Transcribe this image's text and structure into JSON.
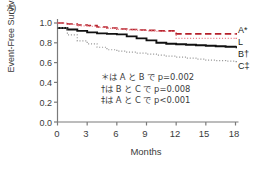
{
  "panel": {
    "label": "A)"
  },
  "axes": {
    "ylabel": "Event-Free Survival",
    "xlabel": "Months",
    "yticks": [
      "1.0",
      "0.8",
      "0.6",
      "0.4",
      "0.2",
      "0.0"
    ],
    "xticks": [
      "0",
      "3",
      "6",
      "9",
      "12",
      "15",
      "18"
    ]
  },
  "curve_labels": [
    {
      "text": "A*",
      "name": "curve-label-a"
    },
    {
      "text": "L",
      "name": "curve-label-l"
    },
    {
      "text": "B†",
      "name": "curve-label-b"
    },
    {
      "text": "C‡",
      "name": "curve-label-c"
    }
  ],
  "notes": [
    "＊は A と B で p=0.002",
    "†は B と C で p=0.008",
    "‡は A と C で p<0.001"
  ],
  "colors": {
    "series_a": "#b5202b",
    "series_l": "#e8838c",
    "series_b": "#111111",
    "series_c": "#9a9a9a",
    "axis": "#7a7a7a",
    "text": "#3b3b3b"
  },
  "chart_data": {
    "type": "line",
    "title": "",
    "subtitle": "",
    "xlabel": "Months",
    "ylabel": "Event-Free Survival",
    "xlim": [
      0,
      18
    ],
    "ylim": [
      0.0,
      1.0
    ],
    "xticks": [
      0,
      3,
      6,
      9,
      12,
      15,
      18
    ],
    "yticks": [
      0.0,
      0.2,
      0.4,
      0.6,
      0.8,
      1.0
    ],
    "grid": false,
    "legend_position": "right-of-plot-inline-labels",
    "step_curves": true,
    "annotations": [
      "＊は A と B で p=0.002",
      "†は B と C で p=0.008",
      "‡は A と C で p<0.001"
    ],
    "series": [
      {
        "name": "A",
        "label": "A*",
        "color": "#b5202b",
        "style": "dashed",
        "width": 1.6,
        "x": [
          0,
          1,
          2,
          3,
          4,
          5,
          6,
          7,
          8,
          9,
          10,
          11,
          12,
          13,
          14,
          15,
          16,
          17,
          18
        ],
        "values": [
          1.0,
          0.99,
          0.98,
          0.975,
          0.96,
          0.95,
          0.94,
          0.935,
          0.93,
          0.925,
          0.92,
          0.92,
          0.89,
          0.89,
          0.89,
          0.89,
          0.89,
          0.89,
          0.89
        ]
      },
      {
        "name": "L",
        "label": "L",
        "color": "#e8838c",
        "style": "dotted",
        "width": 1.2,
        "x": [
          0,
          1,
          2,
          3,
          4,
          5,
          6,
          7,
          8,
          9,
          10,
          11,
          12,
          13,
          14,
          15,
          16,
          17,
          18
        ],
        "values": [
          1.0,
          0.985,
          0.97,
          0.965,
          0.955,
          0.945,
          0.935,
          0.93,
          0.925,
          0.92,
          0.915,
          0.915,
          0.845,
          0.845,
          0.845,
          0.845,
          0.845,
          0.845,
          0.845
        ]
      },
      {
        "name": "B",
        "label": "B†",
        "color": "#111111",
        "style": "solid",
        "width": 1.9,
        "x": [
          0,
          1,
          2,
          3,
          4,
          5,
          6,
          7,
          8,
          9,
          10,
          11,
          12,
          13,
          14,
          15,
          16,
          17,
          18
        ],
        "values": [
          0.95,
          0.935,
          0.92,
          0.905,
          0.895,
          0.89,
          0.885,
          0.865,
          0.845,
          0.825,
          0.8,
          0.79,
          0.785,
          0.78,
          0.775,
          0.77,
          0.765,
          0.76,
          0.755
        ]
      },
      {
        "name": "C",
        "label": "C‡",
        "color": "#9a9a9a",
        "style": "dotted",
        "width": 1.2,
        "x": [
          0,
          1,
          2,
          3,
          4,
          5,
          6,
          7,
          8,
          9,
          10,
          11,
          12,
          13,
          14,
          15,
          16,
          17,
          18
        ],
        "values": [
          0.95,
          0.88,
          0.82,
          0.79,
          0.755,
          0.73,
          0.715,
          0.705,
          0.695,
          0.685,
          0.675,
          0.665,
          0.655,
          0.645,
          0.635,
          0.625,
          0.62,
          0.615,
          0.61
        ]
      }
    ]
  }
}
